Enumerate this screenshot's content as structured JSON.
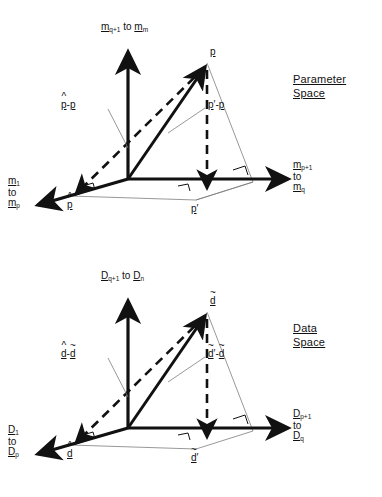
{
  "figure": {
    "type": "vector-space-geometry",
    "panel_count": 2
  },
  "panels": [
    {
      "id": "parameter-space",
      "title_line1": "Parameter",
      "title_line2": "Space",
      "axes": {
        "vertical": {
          "sym": "m",
          "sub_from": "q+1",
          "joiner": "to",
          "sub_to": "m"
        },
        "right": {
          "sym": "m",
          "sub_from": "p+1",
          "joiner": "to",
          "sub_to": "q"
        },
        "left": {
          "sym": "m",
          "sub_from": "1",
          "joiner": "to",
          "sub_to": "p"
        }
      },
      "points": {
        "apex": {
          "label": "p",
          "accent": "none",
          "prime": false
        },
        "left_foot": {
          "label": "p",
          "accent": "hat",
          "prime": false
        },
        "right_foot": {
          "label": "p",
          "accent": "none",
          "prime": true
        }
      },
      "vector_labels": {
        "dashed": {
          "minuend": "p",
          "minuend_accent": "hat",
          "subtrahend": "p",
          "subtrahend_accent": "none",
          "op": "-"
        },
        "thin": {
          "minuend": "p",
          "minuend_accent": "prime",
          "subtrahend": "p",
          "subtrahend_accent": "none",
          "op": "-"
        }
      }
    },
    {
      "id": "data-space",
      "title_line1": "Data",
      "title_line2": "Space",
      "axes": {
        "vertical": {
          "sym": "D",
          "sub_from": "q+1",
          "joiner": "to",
          "sub_to": "n"
        },
        "right": {
          "sym": "D",
          "sub_from": "p+1",
          "joiner": "to",
          "sub_to": "q"
        },
        "left": {
          "sym": "D",
          "sub_from": "1",
          "joiner": "to",
          "sub_to": "p"
        }
      },
      "points": {
        "apex": {
          "label": "d",
          "accent": "tilde",
          "prime": false
        },
        "left_foot": {
          "label": "d",
          "accent": "hat",
          "prime": false
        },
        "right_foot": {
          "label": "d",
          "accent": "tilde",
          "prime": true
        }
      },
      "vector_labels": {
        "dashed": {
          "minuend": "d",
          "minuend_accent": "hat",
          "subtrahend": "d",
          "subtrahend_accent": "tilde",
          "op": "-"
        },
        "thin": {
          "minuend": "d",
          "minuend_accent": "tilde-prime",
          "subtrahend": "d",
          "subtrahend_accent": "tilde",
          "op": "-"
        }
      }
    }
  ],
  "glyphs": {
    "hat": "^",
    "tilde": "~",
    "prime": "′",
    "minus": "-"
  },
  "colors": {
    "ink": "#111111",
    "thin": "#7d7d7d",
    "background": "#ffffff"
  }
}
